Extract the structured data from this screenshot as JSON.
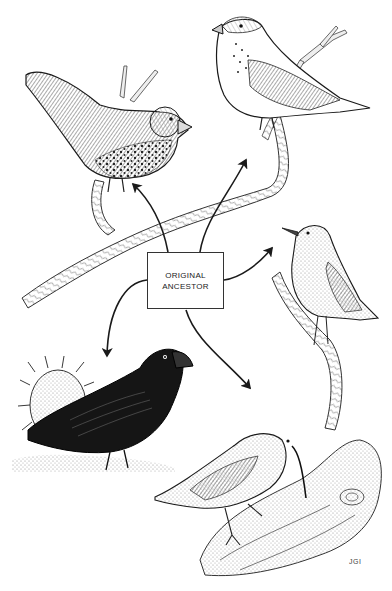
{
  "diagram": {
    "center_label": {
      "line1": "ORIGINAL",
      "line2": "ANCESTOR"
    },
    "signature": "JGI",
    "nodes": [
      {
        "id": "seed-eater-spotted",
        "position": "top-left",
        "description": "finch with spotted breast on branch"
      },
      {
        "id": "finch-pale-breast",
        "position": "top-right",
        "description": "thick-billed finch with pale speckled breast on branch"
      },
      {
        "id": "warbler-finch",
        "position": "right",
        "description": "slender-billed warbler-like bird on twig"
      },
      {
        "id": "ground-finch-dark",
        "position": "bottom-left",
        "description": "dark ground finch beside cactus"
      },
      {
        "id": "long-bill-finch",
        "position": "bottom-right",
        "description": "long curved-bill bird probing a log"
      }
    ],
    "arrows": [
      {
        "from": "center",
        "to": "top-left"
      },
      {
        "from": "center",
        "to": "top-right"
      },
      {
        "from": "center",
        "to": "right"
      },
      {
        "from": "center",
        "to": "bottom-left"
      },
      {
        "from": "center",
        "to": "bottom-right"
      }
    ],
    "colors": {
      "ink": "#1a1a1a",
      "mid": "#6b6b6b",
      "light": "#bdbdbd",
      "paper": "#ffffff"
    }
  }
}
